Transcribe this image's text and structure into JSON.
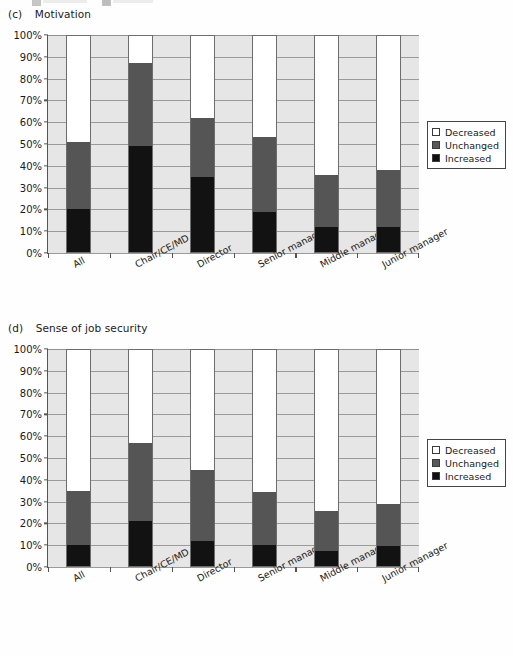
{
  "page": {
    "background": "#fefefe"
  },
  "charts": [
    {
      "id": "c",
      "panel_label": "(c)",
      "title": "Motivation",
      "chart_data": {
        "type": "bar",
        "subtype": "stacked-100-percent",
        "title": "Motivation",
        "panel": "(c)",
        "xlabel": "",
        "ylabel": "",
        "ylim": [
          0,
          100
        ],
        "ytick_labels": [
          "0%",
          "10%",
          "20%",
          "30%",
          "40%",
          "50%",
          "60%",
          "70%",
          "80%",
          "90%",
          "100%"
        ],
        "ytick_values": [
          0,
          10,
          20,
          30,
          40,
          50,
          60,
          70,
          80,
          90,
          100
        ],
        "grid": true,
        "legend_position": "right",
        "categories": [
          "All",
          "Chair/CE/MD",
          "Director",
          "Senior manager",
          "Middle manager",
          "Junior manager"
        ],
        "series": [
          {
            "name": "Increased",
            "color": "#121212",
            "values": [
              20,
              49,
              35,
              19,
              12,
              12
            ]
          },
          {
            "name": "Unchanged",
            "color": "#555555",
            "values": [
              31,
              38,
              27,
              34,
              24,
              26
            ]
          },
          {
            "name": "Decreased",
            "color": "#ffffff",
            "values": [
              49,
              13,
              38,
              47,
              64,
              62
            ]
          }
        ],
        "cumulative_tops": {
          "increased": [
            20,
            49,
            35,
            19,
            12,
            12
          ],
          "unchanged": [
            51,
            87,
            62,
            53,
            36,
            38
          ]
        }
      },
      "legend": {
        "items": [
          {
            "label": "Decreased",
            "swatch": "white"
          },
          {
            "label": "Unchanged",
            "swatch": "gray"
          },
          {
            "label": "Increased",
            "swatch": "black"
          }
        ]
      }
    },
    {
      "id": "d",
      "panel_label": "(d)",
      "title": "Sense of job security",
      "chart_data": {
        "type": "bar",
        "subtype": "stacked-100-percent",
        "title": "Sense of job security",
        "panel": "(d)",
        "xlabel": "",
        "ylabel": "",
        "ylim": [
          0,
          100
        ],
        "ytick_labels": [
          "0%",
          "10%",
          "20%",
          "30%",
          "40%",
          "50%",
          "60%",
          "70%",
          "80%",
          "90%",
          "100%"
        ],
        "ytick_values": [
          0,
          10,
          20,
          30,
          40,
          50,
          60,
          70,
          80,
          90,
          100
        ],
        "grid": true,
        "legend_position": "right",
        "categories": [
          "All",
          "Chair/CE/MD",
          "Director",
          "Senior manager",
          "Middle manager",
          "Junior manager"
        ],
        "series": [
          {
            "name": "Increased",
            "color": "#121212",
            "values": [
              10,
              21,
              12,
              10,
              7.5,
              9.5
            ]
          },
          {
            "name": "Unchanged",
            "color": "#555555",
            "values": [
              25,
              36,
              32.5,
              24.5,
              18,
              19.5
            ]
          },
          {
            "name": "Decreased",
            "color": "#ffffff",
            "values": [
              65,
              43,
              55.5,
              65.5,
              74.5,
              71
            ]
          }
        ],
        "cumulative_tops": {
          "increased": [
            10,
            21,
            12,
            10,
            7.5,
            9.5
          ],
          "unchanged": [
            35,
            57,
            44.5,
            34.5,
            25.5,
            29
          ]
        }
      },
      "legend": {
        "items": [
          {
            "label": "Decreased",
            "swatch": "white"
          },
          {
            "label": "Unchanged",
            "swatch": "gray"
          },
          {
            "label": "Increased",
            "swatch": "black"
          }
        ]
      }
    }
  ]
}
